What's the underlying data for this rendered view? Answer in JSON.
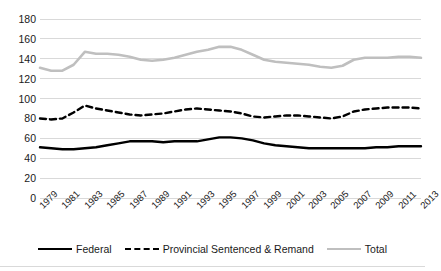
{
  "chart_data": {
    "type": "line",
    "title": "",
    "xlabel": "",
    "ylabel": "",
    "ylim": [
      0,
      180
    ],
    "ytick_step": 20,
    "yticks": [
      180,
      160,
      140,
      120,
      100,
      80,
      60,
      40,
      20,
      0
    ],
    "grid": true,
    "legend_position": "bottom",
    "x": [
      1979,
      1980,
      1981,
      1982,
      1983,
      1984,
      1985,
      1986,
      1987,
      1988,
      1989,
      1990,
      1991,
      1992,
      1993,
      1994,
      1995,
      1996,
      1997,
      1998,
      1999,
      2000,
      2001,
      2002,
      2003,
      2004,
      2005,
      2006,
      2007,
      2008,
      2009,
      2010,
      2011,
      2012,
      2013
    ],
    "tick_labels": [
      "1979",
      "1981",
      "1983",
      "1985",
      "1987",
      "1989",
      "1991",
      "1993",
      "1995",
      "1997",
      "1999",
      "2001",
      "2003",
      "2005",
      "2007",
      "2009",
      "2011",
      "2013"
    ],
    "series": [
      {
        "name": "Federal",
        "color": "#000000",
        "style": "solid",
        "values": [
          51,
          50,
          49,
          49,
          50,
          51,
          53,
          55,
          57,
          57,
          57,
          56,
          57,
          57,
          57,
          59,
          61,
          61,
          60,
          58,
          55,
          53,
          52,
          51,
          50,
          50,
          50,
          50,
          50,
          50,
          51,
          51,
          52,
          52,
          52
        ]
      },
      {
        "name": "Provincial Sentenced & Remand",
        "color": "#000000",
        "style": "dashed",
        "values": [
          80,
          79,
          80,
          86,
          93,
          90,
          88,
          86,
          84,
          83,
          84,
          85,
          87,
          89,
          90,
          89,
          88,
          87,
          85,
          82,
          81,
          82,
          83,
          83,
          82,
          81,
          80,
          82,
          87,
          89,
          90,
          91,
          91,
          91,
          90
        ]
      },
      {
        "name": "Total",
        "color": "#bfbfbf",
        "style": "solid",
        "values": [
          131,
          128,
          128,
          134,
          147,
          145,
          145,
          144,
          142,
          139,
          138,
          139,
          141,
          144,
          147,
          149,
          152,
          152,
          149,
          144,
          139,
          137,
          136,
          135,
          134,
          132,
          131,
          133,
          139,
          141,
          141,
          141,
          142,
          142,
          141
        ]
      }
    ]
  },
  "legend": {
    "items": [
      {
        "label": "Federal",
        "swatch": "solid-black-line"
      },
      {
        "label": "Provincial Sentenced & Remand",
        "swatch": "dashed-black-line"
      },
      {
        "label": "Total",
        "swatch": "solid-gray-line"
      }
    ]
  }
}
